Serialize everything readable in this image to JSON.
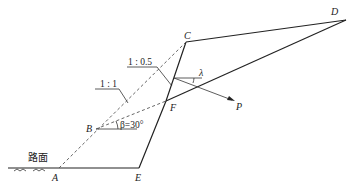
{
  "diagram": {
    "title": "",
    "points": {
      "A": {
        "label": "A",
        "x": 59,
        "y": 168
      },
      "B": {
        "label": "B",
        "x": 96,
        "y": 129
      },
      "C": {
        "label": "C",
        "x": 186,
        "y": 42
      },
      "D": {
        "label": "D",
        "x": 346,
        "y": 20
      },
      "E": {
        "label": "E",
        "x": 139,
        "y": 168
      },
      "F": {
        "label": "F",
        "x": 166,
        "y": 101
      }
    },
    "labels": {
      "road": "路面",
      "slope_ratio_1": "1 : 1",
      "slope_ratio_2": "1 : 0.5",
      "beta": "β=30°",
      "lambda": "λ",
      "force": "P"
    },
    "colors": {
      "line": "#222222",
      "dashed": "#555555",
      "background": "#ffffff"
    }
  }
}
